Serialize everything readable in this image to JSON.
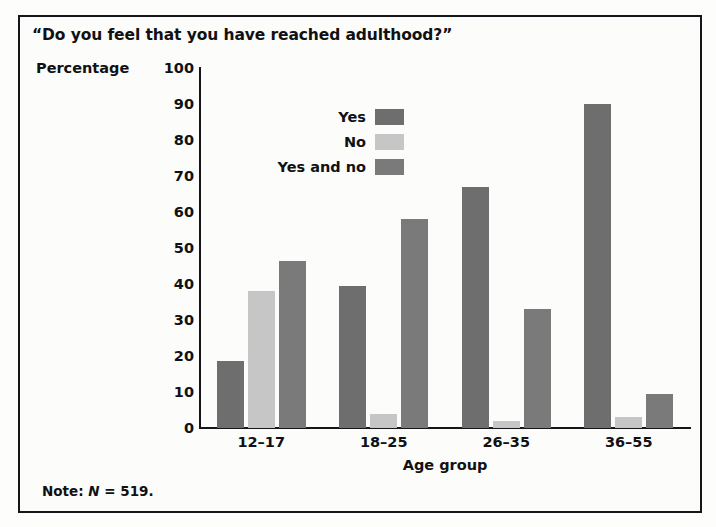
{
  "chart_data": {
    "type": "bar",
    "title": "“Do you feel that you have reached adulthood?”",
    "xlabel": "Age group",
    "ylabel": "Percentage",
    "categories": [
      "12–17",
      "18–25",
      "26–35",
      "36–55"
    ],
    "ylim": [
      0,
      100
    ],
    "yticks": [
      "100",
      "90",
      "80",
      "70",
      "60",
      "50",
      "40",
      "30",
      "20",
      "10",
      "0"
    ],
    "ytick_values": [
      100,
      90,
      80,
      70,
      60,
      50,
      40,
      30,
      20,
      10,
      0
    ],
    "grid": false,
    "legend_position": "upper-left-inside",
    "series": [
      {
        "name": "Yes",
        "color": "#6e6e6e",
        "values": [
          18.5,
          39.5,
          67,
          90
        ]
      },
      {
        "name": "No",
        "color": "#c6c6c6",
        "values": [
          38,
          4,
          2,
          3
        ]
      },
      {
        "name": "Yes and no",
        "color": "#7a7a7a",
        "values": [
          46.5,
          58,
          33,
          9.5
        ]
      }
    ],
    "note_prefix": "Note: ",
    "note_symbol": "N",
    "note_value": " = 519.",
    "note_full": "Note: N = 519."
  },
  "figure": {
    "border_color": "#16161a",
    "background": "#fcfcfb",
    "text_color": "#111114"
  }
}
